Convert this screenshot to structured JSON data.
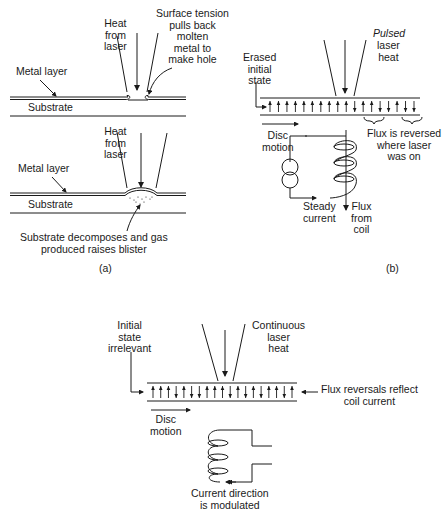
{
  "panel_a": {
    "top": {
      "heat_label": "Heat\nfrom\nlaser",
      "tension_label": "Surface tension\npulls back\nmolten\nmetal to\nmake hole",
      "metal_label": "Metal layer",
      "substrate_label": "Substrate"
    },
    "bottom": {
      "heat_label": "Heat\nfrom\nlaser",
      "metal_label": "Metal layer",
      "substrate_label": "Substrate",
      "blister_label": "Substrate decomposes and gas\nproduced raises blister"
    },
    "caption": "(a)"
  },
  "panel_b": {
    "pulsed_label": "Pulsed",
    "laser_heat_label": "laser\nheat",
    "erased_label": "Erased\ninitial\nstate",
    "disc_motion_label": "Disc\nmotion",
    "flux_reversed_label": "Flux is reversed\nwhere laser\nwas on",
    "steady_current_label": "Steady\ncurrent",
    "flux_from_coil_label": "Flux\nfrom\ncoil",
    "arrow_pattern": [
      "up",
      "up",
      "up",
      "up",
      "up",
      "up",
      "up",
      "up",
      "up",
      "up",
      "down",
      "up",
      "up",
      "down",
      "down",
      "up",
      "down",
      "down"
    ],
    "caption": "(b)"
  },
  "panel_c": {
    "initial_label": "Initial\nstate\nirrelevant",
    "continuous_label": "Continuous\nlaser\nheat",
    "flux_reversals_label": "Flux reversals reflect\ncoil current",
    "disc_motion_label": "Disc\nmotion",
    "current_label": "Current direction\nis modulated",
    "arrow_pattern": [
      "up",
      "up",
      "up",
      "down",
      "up",
      "down",
      "down",
      "up",
      "up",
      "up",
      "down",
      "up",
      "down",
      "up",
      "down",
      "up",
      "up",
      "down",
      "up"
    ]
  }
}
